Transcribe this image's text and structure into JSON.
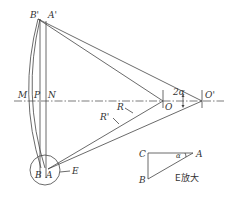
{
  "diagram": {
    "title": "",
    "points": {
      "B_prime": {
        "label": "B'",
        "x": 38,
        "y": 19
      },
      "A_prime": {
        "label": "A'",
        "x": 44,
        "y": 21
      },
      "M": {
        "label": "M",
        "x": 27,
        "y": 101
      },
      "P": {
        "label": "P",
        "x": 40,
        "y": 101
      },
      "N": {
        "label": "N",
        "x": 47,
        "y": 101
      },
      "O": {
        "label": "O",
        "x": 163,
        "y": 101
      },
      "O_prime": {
        "label": "O'",
        "x": 202,
        "y": 101
      },
      "B": {
        "label": "B",
        "x": 41,
        "y": 168
      },
      "A": {
        "label": "A",
        "x": 48,
        "y": 169
      }
    },
    "labels": {
      "B_prime": "B'",
      "A_prime": "A'",
      "M": "M",
      "P": "P",
      "N": "N",
      "O": "O",
      "O_prime": "O'",
      "two_alpha": "2α",
      "R": "R",
      "R_prime": "R'",
      "B": "B",
      "A": "A",
      "E": "E"
    },
    "inset": {
      "C": "C",
      "A": "A",
      "B": "B",
      "alpha": "α",
      "caption": "E放大"
    }
  }
}
